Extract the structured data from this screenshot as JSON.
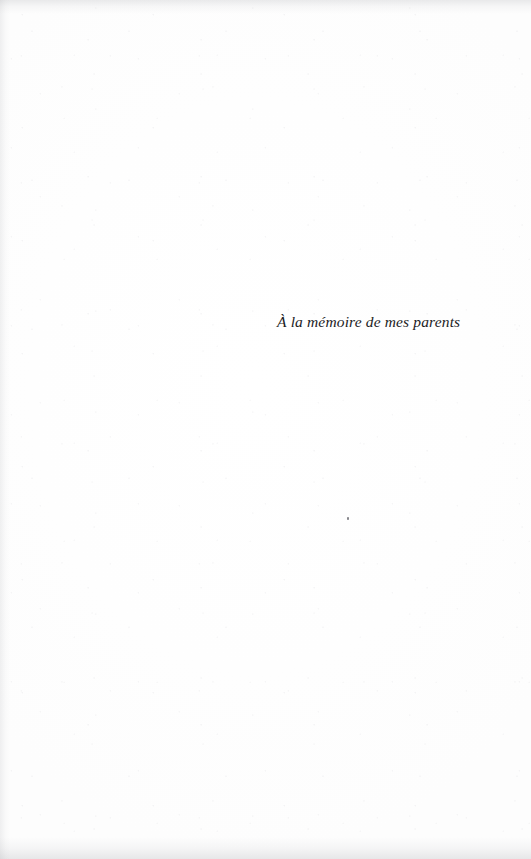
{
  "page": {
    "kind": "book-dedication-page",
    "width": 531,
    "height": 859,
    "background_color": "#fefefe",
    "text_color": "#1c1c1e"
  },
  "dedication": {
    "text": "À la mémoire de mes parents",
    "language": "fr",
    "style": "italic-serif",
    "alignment": "right-block",
    "position": {
      "left_px": 277,
      "top_px": 296,
      "width_px": 183
    }
  },
  "artifacts": {
    "has_scan_speckle": true,
    "has_top_edge_smudge": true,
    "has_bottom_edge_smudge": true,
    "has_left_edge_smudge": true,
    "dust_speck": {
      "left_px": 347,
      "top_px": 517
    }
  }
}
